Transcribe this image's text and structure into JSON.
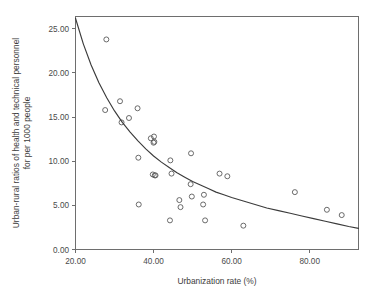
{
  "chart_data": {
    "type": "scatter",
    "title": "",
    "xlabel": "Urbanization rate (%)",
    "ylabel": "Urban-rural ratios of health and technical personnel for per 1000 people",
    "ylabel_line1": "Urban-rural ratios of health and technical personnel",
    "ylabel_line2": "for per 1000 people",
    "xlim": [
      20.0,
      92.5
    ],
    "ylim": [
      0.0,
      26.4
    ],
    "xticks": [
      20.0,
      40.0,
      60.0,
      80.0
    ],
    "yticks": [
      0.0,
      5.0,
      10.0,
      15.0,
      20.0,
      25.0
    ],
    "xticklabels": [
      "20.00",
      "40.00",
      "60.00",
      "80.00"
    ],
    "yticklabels": [
      "0.00",
      "5.00",
      "10.00",
      "15.00",
      "20.00",
      "25.00"
    ],
    "grid": false,
    "legend": "none",
    "marker": "open-circle",
    "marker_color": "#5a5a5a",
    "curve_color": "#3b3b3b",
    "frame_color": "#6e6e6e",
    "background_color": "#ffffff",
    "points": [
      {
        "x": 27.9,
        "y": 23.8
      },
      {
        "x": 27.6,
        "y": 15.8
      },
      {
        "x": 31.4,
        "y": 16.8
      },
      {
        "x": 31.8,
        "y": 14.4
      },
      {
        "x": 33.7,
        "y": 14.9
      },
      {
        "x": 35.9,
        "y": 16.0
      },
      {
        "x": 36.1,
        "y": 10.4
      },
      {
        "x": 36.2,
        "y": 5.1
      },
      {
        "x": 39.3,
        "y": 12.6
      },
      {
        "x": 40.1,
        "y": 12.8
      },
      {
        "x": 40.2,
        "y": 12.2
      },
      {
        "x": 40.0,
        "y": 12.1
      },
      {
        "x": 39.8,
        "y": 8.5
      },
      {
        "x": 40.3,
        "y": 8.4
      },
      {
        "x": 40.5,
        "y": 8.4
      },
      {
        "x": 44.3,
        "y": 10.1
      },
      {
        "x": 44.6,
        "y": 8.6
      },
      {
        "x": 44.2,
        "y": 3.3
      },
      {
        "x": 46.6,
        "y": 5.6
      },
      {
        "x": 46.9,
        "y": 4.8
      },
      {
        "x": 49.6,
        "y": 10.9
      },
      {
        "x": 49.5,
        "y": 7.4
      },
      {
        "x": 49.8,
        "y": 6.0
      },
      {
        "x": 52.9,
        "y": 6.2
      },
      {
        "x": 52.7,
        "y": 5.1
      },
      {
        "x": 53.2,
        "y": 3.3
      },
      {
        "x": 56.9,
        "y": 8.6
      },
      {
        "x": 58.9,
        "y": 8.3
      },
      {
        "x": 63.0,
        "y": 2.7
      },
      {
        "x": 76.2,
        "y": 6.5
      },
      {
        "x": 84.4,
        "y": 4.5
      },
      {
        "x": 88.2,
        "y": 3.9
      }
    ],
    "fit_curve": {
      "description": "decreasing power/exponential trend line",
      "points": [
        {
          "x": 20.0,
          "y": 26.2
        },
        {
          "x": 22.0,
          "y": 23.3
        },
        {
          "x": 24.0,
          "y": 20.9
        },
        {
          "x": 26.0,
          "y": 18.9
        },
        {
          "x": 28.0,
          "y": 17.2
        },
        {
          "x": 30.0,
          "y": 15.7
        },
        {
          "x": 32.0,
          "y": 14.4
        },
        {
          "x": 34.0,
          "y": 13.3
        },
        {
          "x": 36.0,
          "y": 12.3
        },
        {
          "x": 38.0,
          "y": 11.4
        },
        {
          "x": 40.0,
          "y": 10.6
        },
        {
          "x": 42.0,
          "y": 9.9
        },
        {
          "x": 44.0,
          "y": 9.3
        },
        {
          "x": 46.0,
          "y": 8.7
        },
        {
          "x": 48.0,
          "y": 8.2
        },
        {
          "x": 50.0,
          "y": 7.7
        },
        {
          "x": 52.0,
          "y": 7.3
        },
        {
          "x": 54.0,
          "y": 6.9
        },
        {
          "x": 56.0,
          "y": 6.5
        },
        {
          "x": 58.0,
          "y": 6.2
        },
        {
          "x": 60.0,
          "y": 5.9
        },
        {
          "x": 63.0,
          "y": 5.5
        },
        {
          "x": 66.0,
          "y": 5.1
        },
        {
          "x": 69.0,
          "y": 4.7
        },
        {
          "x": 72.0,
          "y": 4.4
        },
        {
          "x": 75.0,
          "y": 4.1
        },
        {
          "x": 78.0,
          "y": 3.8
        },
        {
          "x": 81.0,
          "y": 3.5
        },
        {
          "x": 84.0,
          "y": 3.2
        },
        {
          "x": 87.0,
          "y": 2.9
        },
        {
          "x": 90.0,
          "y": 2.6
        },
        {
          "x": 92.5,
          "y": 2.4
        }
      ]
    }
  }
}
